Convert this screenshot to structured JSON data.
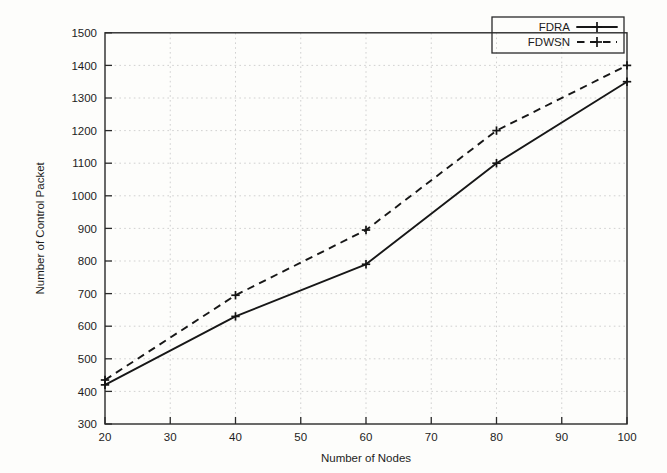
{
  "chart_data": {
    "type": "line",
    "title": "",
    "xlabel": "Number of Nodes",
    "ylabel": "Number of Control Packet",
    "x": [
      20,
      40,
      60,
      80,
      100
    ],
    "xlim": [
      20,
      100
    ],
    "ylim": [
      300,
      1500
    ],
    "xticks": [
      20,
      30,
      40,
      50,
      60,
      70,
      80,
      90,
      100
    ],
    "yticks": [
      300,
      400,
      500,
      600,
      700,
      800,
      900,
      1000,
      1100,
      1200,
      1300,
      1400,
      1500
    ],
    "xtick_labels": [
      "20",
      "30",
      "40",
      "50",
      "60",
      "70",
      "80",
      "90",
      "100"
    ],
    "ytick_labels": [
      "300",
      "400",
      "500",
      "600",
      "700",
      "800",
      "900",
      "1000",
      "1100",
      "1200",
      "1300",
      "1400",
      "1500"
    ],
    "grid": true,
    "legend_position": "top-right",
    "series": [
      {
        "name": "FDRA",
        "values": [
          420,
          630,
          790,
          1100,
          1350
        ],
        "style": "solid",
        "marker": "plus",
        "color": "#171717"
      },
      {
        "name": "FDWSN",
        "values": [
          435,
          695,
          895,
          1200,
          1400
        ],
        "style": "dashed",
        "marker": "plus",
        "color": "#171717"
      }
    ]
  },
  "legend": {
    "entries": [
      {
        "label": "FDRA"
      },
      {
        "label": "FDWSN"
      }
    ]
  },
  "axes": {
    "x_title": "Number of Nodes",
    "y_title": "Number of Control Packet"
  },
  "xtick_text": {
    "t0": "20",
    "t1": "30",
    "t2": "40",
    "t3": "50",
    "t4": "60",
    "t5": "70",
    "t6": "80",
    "t7": "90",
    "t8": "100"
  },
  "ytick_text": {
    "t0": "300",
    "t1": "400",
    "t2": "500",
    "t3": "600",
    "t4": "700",
    "t5": "800",
    "t6": "900",
    "t7": "1000",
    "t8": "1100",
    "t9": "1200",
    "t10": "1300",
    "t11": "1400",
    "t12": "1500"
  }
}
